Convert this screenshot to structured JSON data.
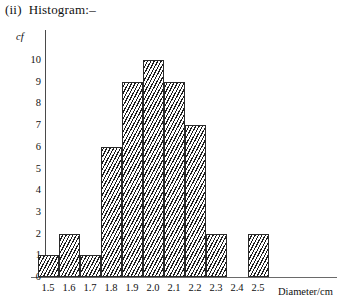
{
  "title": {
    "index": "(ii)",
    "text": "Histogram:–"
  },
  "chart_data": {
    "type": "bar",
    "title": "Histogram",
    "xlabel": "Diameter/cm",
    "ylabel": "cf",
    "categories": [
      "1.5",
      "1.6",
      "1.7",
      "1.8",
      "1.9",
      "2.0",
      "2.1",
      "2.2",
      "2.3",
      "2.4",
      "2.5"
    ],
    "values": [
      1,
      2,
      1,
      6,
      9,
      10,
      9,
      7,
      2,
      0,
      2
    ],
    "ylim": [
      0,
      10
    ],
    "yticks": [
      "0",
      "1",
      "2",
      "3",
      "4",
      "5",
      "6",
      "7",
      "8",
      "9",
      "10"
    ],
    "xlim": [
      "1.5",
      "2.5"
    ],
    "grid": false,
    "legend": "none",
    "bar_fill": "diagonal-hatch",
    "bar_edge_color": "#2b2b2b"
  }
}
